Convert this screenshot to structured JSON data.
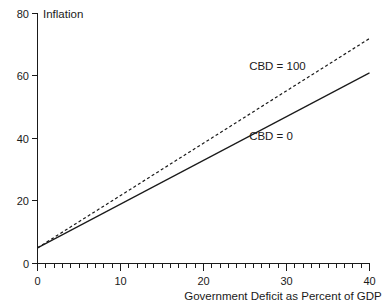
{
  "chart_data": {
    "type": "line",
    "title": "",
    "xlabel": "Government Deficit as Percent of GDP",
    "ylabel": "Inflation",
    "xlim": [
      0,
      40
    ],
    "ylim": [
      0,
      80
    ],
    "grid": false,
    "legend_position": "inline-annotation",
    "x_ticks": [
      0,
      10,
      20,
      30,
      40
    ],
    "x_tick_labels": [
      "0",
      "10",
      "20",
      "30",
      "40"
    ],
    "x_minor_tick_step": 1,
    "y_ticks": [
      0,
      20,
      40,
      60,
      80
    ],
    "y_tick_labels": [
      "0",
      "20",
      "40",
      "60",
      "80"
    ],
    "series": [
      {
        "name": "CBD = 0",
        "style": "solid",
        "color": "#1a1a1a",
        "x": [
          0,
          40
        ],
        "values": [
          5,
          61
        ],
        "annotation": "CBD = 0"
      },
      {
        "name": "CBD = 100",
        "style": "dashed",
        "color": "#1a1a1a",
        "x": [
          0,
          40
        ],
        "values": [
          5,
          72
        ],
        "annotation": "CBD = 100"
      }
    ],
    "annotations": [
      {
        "text": "CBD = 100",
        "x": 25.5,
        "y": 62
      },
      {
        "text": "CBD = 0",
        "x": 25.5,
        "y": 39.5
      }
    ]
  },
  "axis": {
    "y_label": "Inflation",
    "x_label": "Government Deficit as Percent of GDP",
    "y_tick_80": "80",
    "y_tick_60": "60",
    "y_tick_40": "40",
    "y_tick_20": "20",
    "y_tick_0": "0",
    "x_tick_0": "0",
    "x_tick_10": "10",
    "x_tick_20": "20",
    "x_tick_30": "30",
    "x_tick_40": "40"
  },
  "labels": {
    "cbd_100": "CBD = 100",
    "cbd_0": "CBD = 0"
  },
  "colors": {
    "ink": "#1a1a1a",
    "background": "#ffffff"
  }
}
